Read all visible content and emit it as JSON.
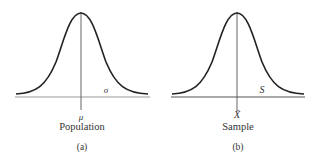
{
  "panels": [
    {
      "id": "a",
      "center_label": "μ",
      "spread_label": "σ",
      "title": "Population",
      "tag": "(a)"
    },
    {
      "id": "b",
      "center_label": "X̄",
      "spread_label": "S",
      "title": "Sample",
      "tag": "(b)"
    }
  ],
  "colors": {
    "curve": "#222222",
    "axis": "#999999",
    "text": "#333333"
  }
}
